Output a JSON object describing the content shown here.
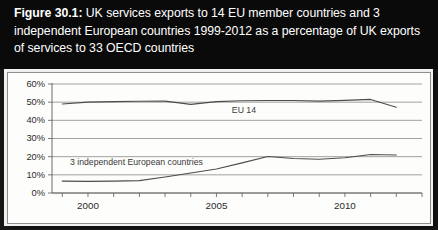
{
  "figure": {
    "label": "Figure 30.1:",
    "caption": " UK services exports to 14 EU member countries and 3 independent European countries 1999-2012 as a percentage of UK exports of services to 33 OECD countries",
    "full_title": "Figure 30.1: UK services exports to 14 EU member countries and 3 independent European countries 1999-2012 as a percentage of UK exports of services to 33 OECD countries"
  },
  "chart_data": {
    "type": "line",
    "title": "UK services exports to 14 EU member countries and 3 independent European countries 1999-2012 as a percentage of UK exports of services to 33 OECD countries",
    "xlabel": "",
    "ylabel": "",
    "x": [
      1999,
      2000,
      2001,
      2002,
      2003,
      2004,
      2005,
      2006,
      2007,
      2008,
      2009,
      2010,
      2011,
      2012
    ],
    "xlim": [
      1998.6,
      2013.0
    ],
    "ylim": [
      0,
      60
    ],
    "yticks": [
      0,
      10,
      20,
      30,
      40,
      50,
      60
    ],
    "ytick_labels": [
      "0%",
      "10%",
      "20%",
      "30%",
      "40%",
      "50%",
      "60%"
    ],
    "xtick_labels": [
      "2000",
      "2005",
      "2010"
    ],
    "xtick_values": [
      2000,
      2005,
      2010
    ],
    "xtick_minor_every": 1,
    "grid": "horizontal",
    "legend": "inline-labels",
    "series": [
      {
        "name": "EU 14",
        "label_x": 2005.6,
        "label_y": 44.0,
        "values": [
          49.0,
          50.0,
          50.3,
          50.5,
          50.6,
          48.8,
          50.3,
          50.8,
          50.9,
          50.9,
          50.6,
          51.0,
          51.5,
          47.2
        ]
      },
      {
        "name": "3 independent European countries",
        "label_x": 1999.3,
        "label_y": 15.5,
        "values": [
          6.5,
          6.4,
          6.5,
          6.8,
          8.8,
          11.0,
          13.2,
          16.6,
          20.1,
          19.0,
          18.6,
          19.4,
          21.2,
          20.9
        ]
      }
    ]
  }
}
